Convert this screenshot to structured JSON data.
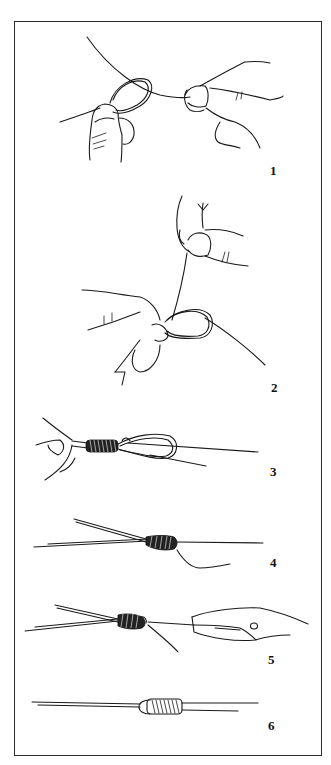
{
  "figure": {
    "border_color": "#2a2a2a",
    "line_color": "#1a1a1a",
    "steps": [
      {
        "number": "1",
        "depiction": "Two hands forming a loop in the line"
      },
      {
        "number": "2",
        "depiction": "Hands passing the tag end through the loop"
      },
      {
        "number": "3",
        "depiction": "Line wrapped in coils around the doubled section with loop"
      },
      {
        "number": "4",
        "depiction": "Wraps tightened into a tapered knot"
      },
      {
        "number": "5",
        "depiction": "Pliers pulling the tag end to seat the knot"
      },
      {
        "number": "6",
        "depiction": "Finished knot with neat coiled wraps"
      }
    ]
  }
}
